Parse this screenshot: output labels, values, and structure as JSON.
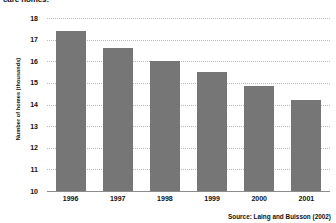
{
  "chart_data": {
    "type": "bar",
    "title": "care homes:",
    "subtitle": "",
    "xlabel": "",
    "ylabel": "Number of homes (thousands)",
    "categories": [
      "1996",
      "1997",
      "1998",
      "1999",
      "2000",
      "2001"
    ],
    "values": [
      17.4,
      16.6,
      16.0,
      15.5,
      14.85,
      14.2
    ],
    "ylim": [
      10,
      18
    ],
    "ytick_step": 1,
    "ytick_labels": [
      "18",
      "17",
      "16",
      "15",
      "14",
      "13",
      "12",
      "11",
      "10"
    ],
    "grid": true,
    "legend": "none",
    "bar_color": "#767676",
    "gridline_color": "#b9b9b9",
    "axis_color": "#8c8c8c",
    "source": "Source: Laing and Buisson (2002)"
  }
}
